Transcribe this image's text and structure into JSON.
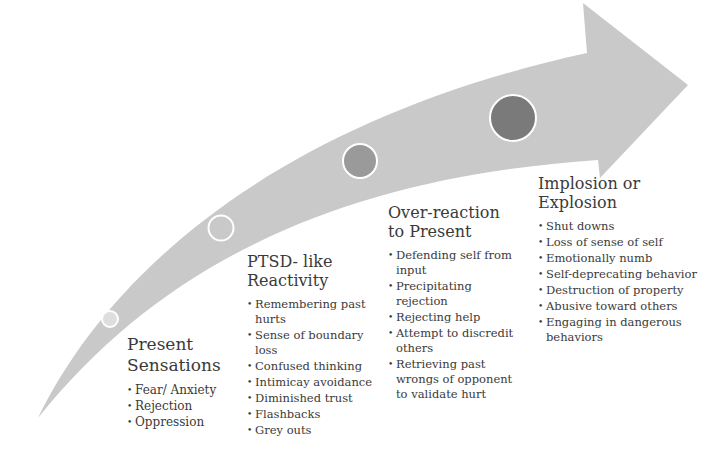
{
  "diagram": {
    "type": "curved-progression-arrow",
    "colors": {
      "arrow_fill": "#c9c9c9",
      "marker_stroke": "#ffffff",
      "text": "#3a3a3a"
    },
    "markers": [
      {
        "stage": 1,
        "style": "light-filled",
        "fill": "#dedede"
      },
      {
        "stage": 2,
        "style": "hollow",
        "fill": "none"
      },
      {
        "stage": 3,
        "style": "filled",
        "fill": "#9a9a9a"
      },
      {
        "stage": 4,
        "style": "filled",
        "fill": "#7a7a7a"
      }
    ],
    "stages": [
      {
        "title_line1": "Present",
        "title_line2": "Sensations",
        "items": [
          "Fear/ Anxiety",
          "Rejection",
          "Oppression"
        ]
      },
      {
        "title_line1": "PTSD- like",
        "title_line2": "Reactivity",
        "items": [
          "Remembering past hurts",
          "Sense of boundary loss",
          "Confused thinking",
          "Intimicay avoidance",
          "Diminished trust",
          "Flashbacks",
          "Grey outs"
        ]
      },
      {
        "title_line1": "Over-reaction",
        "title_line2": "to Present",
        "items": [
          "Defending self from input",
          "Precipitating rejection",
          "Rejecting help",
          "Attempt to discredit others",
          "Retrieving past wrongs of opponent to validate hurt"
        ]
      },
      {
        "title_line1": "Implosion or",
        "title_line2": "Explosion",
        "items": [
          "Shut downs",
          "Loss of sense of self",
          "Emotionally numb",
          "Self-deprecating behavior",
          "Destruction of property",
          "Abusive toward others",
          "Engaging in dangerous behaviors"
        ]
      }
    ]
  }
}
